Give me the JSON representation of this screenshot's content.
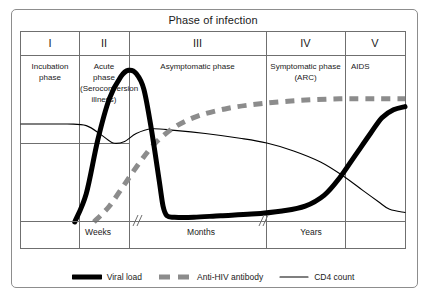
{
  "figure": {
    "title": "Phase of infection"
  },
  "phases": [
    {
      "numeral": "I",
      "description": "Incubation\nphase"
    },
    {
      "numeral": "II",
      "description": "Acute\nphase\n(Seroconversion\nillness)"
    },
    {
      "numeral": "III",
      "description": "Asymptomatic phase"
    },
    {
      "numeral": "IV",
      "description": "Symptomatic phase\n(ARC)"
    },
    {
      "numeral": "V",
      "description": "AIDS"
    }
  ],
  "time_axis": {
    "labels": [
      "Weeks",
      "Months",
      "Years"
    ],
    "breaks": 2
  },
  "legend": [
    {
      "label": "Viral load",
      "style": "thick-solid",
      "color": "#000000"
    },
    {
      "label": "Anti-HIV antibody",
      "style": "thick-dashed",
      "color": "#8c8c8c"
    },
    {
      "label": "CD4 count",
      "style": "thin-solid",
      "color": "#000000"
    }
  ],
  "colors": {
    "viral_load": "#000000",
    "antibody": "#8c8c8c",
    "cd4": "#000000",
    "frame": "#6f6f6f",
    "outer_frame": "#8d8d8d",
    "text": "#1a1a1a"
  },
  "chart_data": {
    "type": "line",
    "title": "Phase of infection",
    "xlabel": "",
    "ylabel": "",
    "x_axis_segments": [
      "Weeks",
      "Months",
      "Years"
    ],
    "grid": false,
    "legend_position": "bottom",
    "phase_boundaries_pct": [
      0,
      15,
      30,
      63.5,
      84,
      100
    ],
    "series": [
      {
        "name": "Viral load",
        "style": "thick-solid",
        "color": "#000000",
        "points": [
          [
            14,
            0
          ],
          [
            17,
            18
          ],
          [
            20,
            52
          ],
          [
            23,
            78
          ],
          [
            26,
            92
          ],
          [
            28,
            96
          ],
          [
            30,
            94
          ],
          [
            32,
            84
          ],
          [
            34,
            58
          ],
          [
            36,
            26
          ],
          [
            37,
            10
          ],
          [
            38,
            4
          ],
          [
            40,
            3
          ],
          [
            45,
            3
          ],
          [
            52,
            4
          ],
          [
            60,
            5
          ],
          [
            68,
            7
          ],
          [
            74,
            10
          ],
          [
            79,
            17
          ],
          [
            83,
            28
          ],
          [
            87,
            42
          ],
          [
            91,
            56
          ],
          [
            94,
            66
          ],
          [
            97,
            71
          ],
          [
            100,
            73
          ]
        ]
      },
      {
        "name": "Anti-HIV antibody",
        "style": "thick-dashed",
        "color": "#8c8c8c",
        "points": [
          [
            19,
            0
          ],
          [
            23,
            10
          ],
          [
            27,
            24
          ],
          [
            31,
            38
          ],
          [
            35,
            50
          ],
          [
            40,
            60
          ],
          [
            46,
            67
          ],
          [
            54,
            72
          ],
          [
            63,
            75
          ],
          [
            73,
            77
          ],
          [
            83,
            78
          ],
          [
            92,
            78
          ],
          [
            100,
            78
          ]
        ]
      },
      {
        "name": "CD4 count",
        "style": "thin-solid",
        "color": "#000000",
        "points": [
          [
            0,
            62
          ],
          [
            12,
            62
          ],
          [
            17,
            61
          ],
          [
            21,
            55
          ],
          [
            24,
            50
          ],
          [
            27,
            51
          ],
          [
            30,
            56
          ],
          [
            34,
            59
          ],
          [
            40,
            58
          ],
          [
            48,
            56
          ],
          [
            57,
            53
          ],
          [
            64,
            50
          ],
          [
            71,
            45
          ],
          [
            78,
            38
          ],
          [
            84,
            29
          ],
          [
            89,
            20
          ],
          [
            93,
            13
          ],
          [
            96,
            8
          ],
          [
            100,
            6
          ]
        ]
      }
    ]
  }
}
